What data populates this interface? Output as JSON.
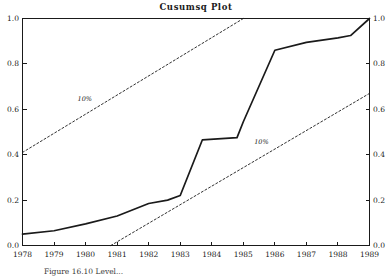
{
  "chart_data": {
    "type": "line",
    "title": "Cusumsq Plot",
    "xlabel": "",
    "ylabel": "",
    "xlim": [
      1978,
      1989
    ],
    "ylim": [
      0.0,
      1.0
    ],
    "grid": false,
    "legend_position": "inline-annotation",
    "x_tick_labels": [
      "1978",
      "1979",
      "1980",
      "1981",
      "1982",
      "1983",
      "1984",
      "1985",
      "1986",
      "1987",
      "1988",
      "1989"
    ],
    "y_tick_labels_left": [
      "0.0",
      "0.2",
      "0.4",
      "0.6",
      "0.8",
      "1.0"
    ],
    "y_tick_labels_right": [
      "0.0",
      "0.2",
      "0.4",
      "0.6",
      "0.8",
      "1.0"
    ],
    "y_ticks": [
      0.0,
      0.2,
      0.4,
      0.6,
      0.8,
      1.0
    ],
    "dual_y_axis": true,
    "series": [
      {
        "name": "Cusumsq",
        "style": "solid",
        "x": [
          1978,
          1979,
          1980,
          1981,
          1982,
          1982.6,
          1983,
          1983.7,
          1984.8,
          1985,
          1986,
          1987,
          1988,
          1988.4,
          1989
        ],
        "values": [
          0.05,
          0.065,
          0.095,
          0.13,
          0.185,
          0.2,
          0.22,
          0.465,
          0.475,
          0.545,
          0.86,
          0.895,
          0.915,
          0.925,
          1.0
        ]
      },
      {
        "name": "10% upper bound",
        "style": "dashed",
        "x": [
          1978,
          1985
        ],
        "values": [
          0.41,
          1.0
        ]
      },
      {
        "name": "10% lower bound",
        "style": "dashed",
        "x": [
          1980.8,
          1989
        ],
        "values": [
          0.0,
          0.67
        ]
      }
    ],
    "annotations": [
      {
        "text": "10%",
        "x": 1980.0,
        "y": 0.645,
        "name": "upper-bound-label"
      },
      {
        "text": "10%",
        "x": 1985.6,
        "y": 0.455,
        "name": "lower-bound-label"
      }
    ]
  },
  "figure": {
    "caption": "Figure 16.10 Level..."
  }
}
